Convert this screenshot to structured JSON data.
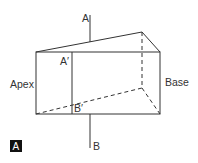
{
  "figure": {
    "panel_label": "A",
    "labels": {
      "axis_top": "A",
      "axis_bottom": "B",
      "inner_top": "A′",
      "inner_bottom": "B′",
      "left_face": "Apex",
      "right_face": "Base"
    },
    "colors": {
      "line": "#333333",
      "badge_bg": "#111111",
      "badge_text": "#ffffff",
      "background": "#ffffff"
    }
  }
}
